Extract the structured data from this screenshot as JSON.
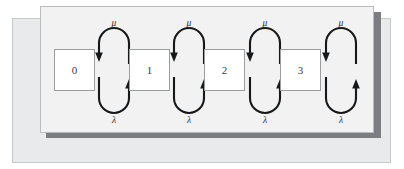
{
  "figure": {
    "caption": ""
  },
  "panels": {
    "outer": {
      "name": "outer-backdrop-panel",
      "color": "#e9eaeb",
      "border": "#c6c8ca"
    },
    "inner": {
      "name": "inner-diagram-panel",
      "color": "#f2f2f3",
      "border": "#b9bbbd",
      "shadow": "#7b7d80"
    }
  },
  "diagram": {
    "type": "state-transition-chain",
    "box_fill": "#ffffff",
    "box_stroke": "#9a9c9f",
    "arrow_color": "#17181a",
    "states": [
      {
        "label": "0",
        "x": 13,
        "y": 42
      },
      {
        "label": "1",
        "x": 88,
        "y": 42
      },
      {
        "label": "2",
        "x": 163,
        "y": 42
      },
      {
        "label": "3",
        "x": 239,
        "y": 42
      }
    ],
    "state_box": {
      "width": 40,
      "height": 41
    },
    "transitions": [
      {
        "gap_center": 73,
        "up_label": "μ",
        "down_label": "λ",
        "up_direction": "left",
        "down_direction": "right"
      },
      {
        "gap_center": 148,
        "up_label": "μ",
        "down_label": "λ",
        "up_direction": "left",
        "down_direction": "right"
      },
      {
        "gap_center": 224,
        "up_label": "μ",
        "down_label": "λ",
        "up_direction": "left",
        "down_direction": "right"
      },
      {
        "gap_center": 300,
        "up_label": "μ",
        "down_label": "λ",
        "up_direction": "left",
        "down_direction": "right"
      }
    ],
    "rate_labels": {
      "birth_rate": "λ",
      "death_rate": "μ"
    }
  }
}
